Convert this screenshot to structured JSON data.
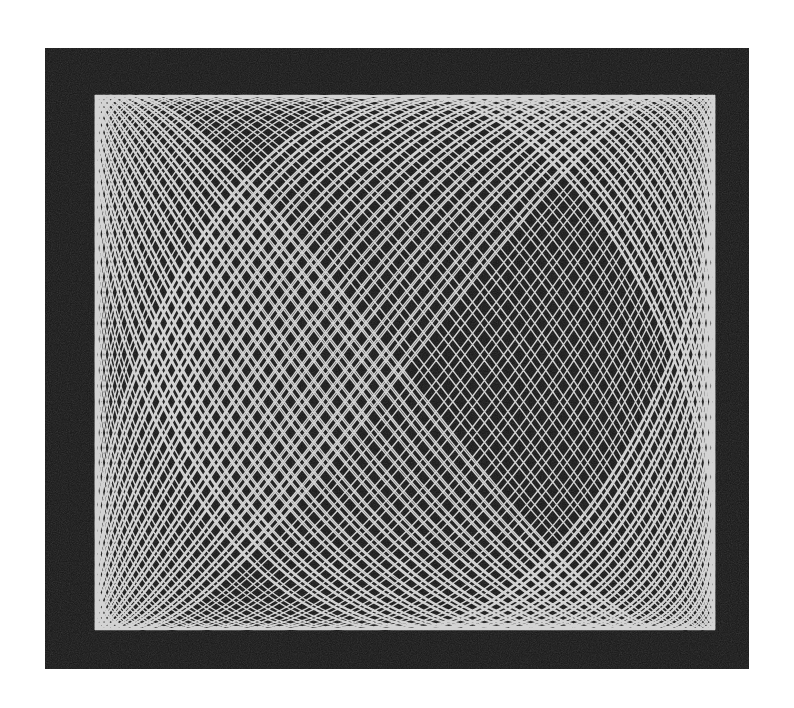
{
  "image": {
    "subject": "Harmonograph / Lissajous figure photograph",
    "background_color": "#161616",
    "line_color": "#f2f2f2",
    "page_color": "#ffffff"
  },
  "figure": {
    "x": {
      "freq": 2.0,
      "phase": 0.0,
      "drift": 0.0021,
      "amp": 0.44
    },
    "y": {
      "freq": 3.0,
      "phase": 1.5707963,
      "drift": 0.0,
      "amp": 0.43
    },
    "cycles": 300,
    "steps": 24000,
    "stroke_width": 1.4
  }
}
